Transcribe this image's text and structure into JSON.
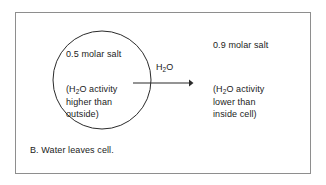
{
  "figure": {
    "caption": "B.  Water leaves cell.",
    "border_color": "#8e8e8e",
    "background": "#ffffff",
    "ink_color": "#1b1b1b"
  },
  "cell": {
    "shape": "circle",
    "center_x": 102,
    "center_y": 80,
    "radius": 49,
    "inside_concentration": "0.5 molar salt",
    "inside_activity": "(H₂O activity\nhigher than\noutside)",
    "inside_activity_prefix": "(H",
    "inside_activity_sub": "2",
    "inside_activity_suffix": "O activity\nhigher than\noutside)"
  },
  "exterior": {
    "outside_concentration": "0.9 molar salt",
    "outside_activity_prefix": "(H",
    "outside_activity_sub": "2",
    "outside_activity_suffix": "O activity\nlower than\ninside cell)"
  },
  "flow_arrow": {
    "label_prefix": "H",
    "label_sub": "2",
    "label_suffix": "O",
    "direction": "right",
    "start_x": 133,
    "end_x": 192,
    "y": 83,
    "meaning": "water-leaves-cell"
  }
}
